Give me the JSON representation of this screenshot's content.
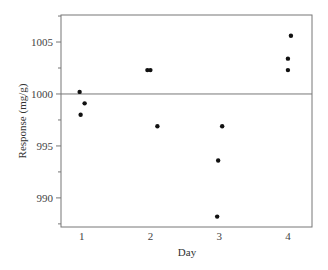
{
  "chart_data": {
    "type": "scatter",
    "title": "",
    "xlabel": "Day",
    "ylabel": "Response (mg/g)",
    "x_ticks": [
      1,
      2,
      3,
      4
    ],
    "y_ticks": [
      990,
      995,
      1000,
      1005
    ],
    "y_minor_tick_step": 2.5,
    "xlim": [
      0.7,
      4.35
    ],
    "ylim": [
      987.2,
      1007.6
    ],
    "reference_line": {
      "y": 1000
    },
    "grid": false,
    "legend": null,
    "series": [
      {
        "name": "Response",
        "points": [
          {
            "x": 1,
            "y": 1000.2
          },
          {
            "x": 1,
            "y": 999.1
          },
          {
            "x": 1,
            "y": 998.0
          },
          {
            "x": 2,
            "y": 1002.3
          },
          {
            "x": 2,
            "y": 1002.3
          },
          {
            "x": 2,
            "y": 996.9
          },
          {
            "x": 3,
            "y": 996.9
          },
          {
            "x": 3,
            "y": 993.6
          },
          {
            "x": 3,
            "y": 988.2
          },
          {
            "x": 4,
            "y": 1005.6
          },
          {
            "x": 4,
            "y": 1003.4
          },
          {
            "x": 4,
            "y": 1002.3
          }
        ],
        "jitter_px": [
          -2,
          3,
          -1,
          -3,
          0,
          7,
          3,
          -1,
          -2,
          3,
          0,
          0
        ]
      }
    ]
  }
}
